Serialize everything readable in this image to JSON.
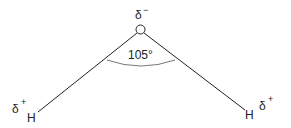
{
  "diagram": {
    "molecule": "water",
    "central_atom": {
      "symbol": "O",
      "charge_label": "δ",
      "charge_sign": "−"
    },
    "left_atom": {
      "symbol": "H",
      "charge_label": "δ",
      "charge_sign": "+"
    },
    "right_atom": {
      "symbol": "H",
      "charge_label": "δ",
      "charge_sign": "+"
    },
    "bond_angle": "105°",
    "colors": {
      "line": "#222222",
      "arc": "#777777"
    }
  }
}
